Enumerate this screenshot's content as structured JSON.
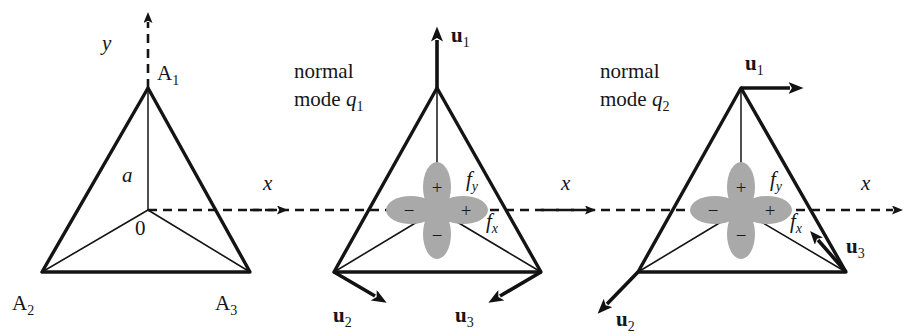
{
  "figure": {
    "background_color": "#ffffff",
    "stroke_color": "#141414",
    "lobe_color": "#a9a9a9"
  },
  "panels": [
    {
      "id": "panel-geometry",
      "caption": "",
      "caption_line1": "",
      "caption_line2": "",
      "axes": {
        "x_label": "x",
        "y_label": "y",
        "x_style": "dashed-arrow",
        "y_style": "dashed-arrow"
      },
      "origin_label": "0",
      "length_label": "a",
      "vertices": [
        {
          "name": "A",
          "index": "1"
        },
        {
          "name": "A",
          "index": "2"
        },
        {
          "name": "A",
          "index": "3"
        }
      ],
      "vertex_labels": [
        "A₁",
        "A₂",
        "A₃"
      ],
      "orbital": null,
      "displacements": []
    },
    {
      "id": "panel-mode-q1",
      "caption": "normal mode q₁",
      "caption_line1": "normal",
      "caption_line2_prefix": "mode ",
      "caption_mode_symbol": "q",
      "caption_mode_index": "1",
      "axes": {
        "x_label": "x",
        "y_label": "",
        "x_style": "dashed-arrow",
        "y_style": "none"
      },
      "orbital": {
        "type": "four-lobe",
        "lobes": [
          {
            "position": "top",
            "sign": "+"
          },
          {
            "position": "right",
            "sign": "+"
          },
          {
            "position": "left",
            "sign": "−"
          },
          {
            "position": "bottom",
            "sign": "−"
          }
        ],
        "label_y": "f",
        "label_y_sub": "y",
        "label_x": "f",
        "label_x_sub": "x"
      },
      "displacements": [
        {
          "symbol": "u",
          "index": "1",
          "direction": "up"
        },
        {
          "symbol": "u",
          "index": "2",
          "direction": "down-right"
        },
        {
          "symbol": "u",
          "index": "3",
          "direction": "down-left"
        }
      ]
    },
    {
      "id": "panel-mode-q2",
      "caption": "normal mode q₂",
      "caption_line1": "normal",
      "caption_line2_prefix": "mode ",
      "caption_mode_symbol": "q",
      "caption_mode_index": "2",
      "axes": {
        "x_label": "x",
        "y_label": "",
        "x_style": "dashed-arrow",
        "y_style": "none"
      },
      "orbital": {
        "type": "four-lobe",
        "lobes": [
          {
            "position": "top",
            "sign": "+"
          },
          {
            "position": "right",
            "sign": "+"
          },
          {
            "position": "left",
            "sign": "−"
          },
          {
            "position": "bottom",
            "sign": "−"
          }
        ],
        "label_y": "f",
        "label_y_sub": "y",
        "label_x": "f",
        "label_x_sub": "x"
      },
      "displacements": [
        {
          "symbol": "u",
          "index": "1",
          "direction": "right"
        },
        {
          "symbol": "u",
          "index": "2",
          "direction": "down-left"
        },
        {
          "symbol": "u",
          "index": "3",
          "direction": "up-right"
        }
      ]
    }
  ],
  "symbols": {
    "u": "u",
    "f": "f",
    "q": "q",
    "x": "x",
    "y": "y",
    "a": "a",
    "zero": "0",
    "A": "A",
    "plus": "+",
    "minus": "−",
    "normal": "normal",
    "mode": "mode"
  }
}
